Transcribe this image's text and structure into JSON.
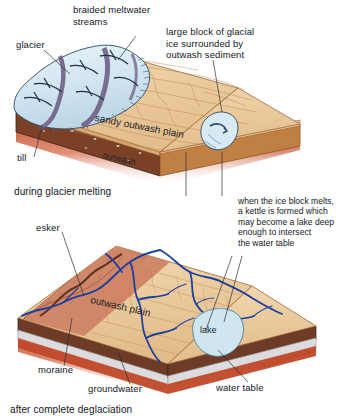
{
  "figure": {
    "type": "geology-block-diagram"
  },
  "panels": [
    {
      "id": "upper",
      "caption": "during glacier melting",
      "map_labels": [
        {
          "name": "sandy-outwash-plain",
          "text": "sandy outwash plain"
        },
        {
          "name": "outwash",
          "text": "outwash"
        }
      ],
      "callouts": [
        {
          "name": "glacier",
          "text": "glacier"
        },
        {
          "name": "braided-meltwater-streams",
          "text": "braided meltwater\nstreams"
        },
        {
          "name": "till",
          "text": "till"
        },
        {
          "name": "ice-block",
          "text": "large block of glacial\nice surrounded by\noutwash sediment"
        }
      ]
    },
    {
      "id": "lower",
      "caption": "after complete deglaciation",
      "map_labels": [
        {
          "name": "outwash-plain",
          "text": "outwash plain"
        },
        {
          "name": "lake",
          "text": "lake"
        }
      ],
      "callouts": [
        {
          "name": "esker",
          "text": "esker"
        },
        {
          "name": "moraine",
          "text": "moraine"
        },
        {
          "name": "groundwater",
          "text": "groundwater"
        },
        {
          "name": "water-table",
          "text": "water table"
        }
      ]
    }
  ],
  "side_note": {
    "name": "kettle-explanation",
    "lines": [
      "when the ice block melts,",
      "a kettle is formed which",
      "may become a lake deep",
      "enough to intersect",
      "the water table"
    ],
    "text": "when the ice block melts,\na kettle is formed which\nmay become a lake deep\nenough to intersect\nthe water table"
  },
  "colors": {
    "sand": "#e9c89a",
    "sand_dark": "#d8ab72",
    "contour": "#c08a52",
    "moraine": "#d0886a",
    "till": "#6d3b26",
    "side_brown": "#c07f43",
    "bedrock_red": "#c4secondary",
    "basement": "#c0492a",
    "ice": "#d8e9f3",
    "ice_band": "#6f5f86",
    "stream": "#1f3f9e",
    "lake": "#cfe6ef",
    "groundwater": "#dcdcde",
    "text": "#14161d",
    "leader": "#2b2f3a"
  }
}
